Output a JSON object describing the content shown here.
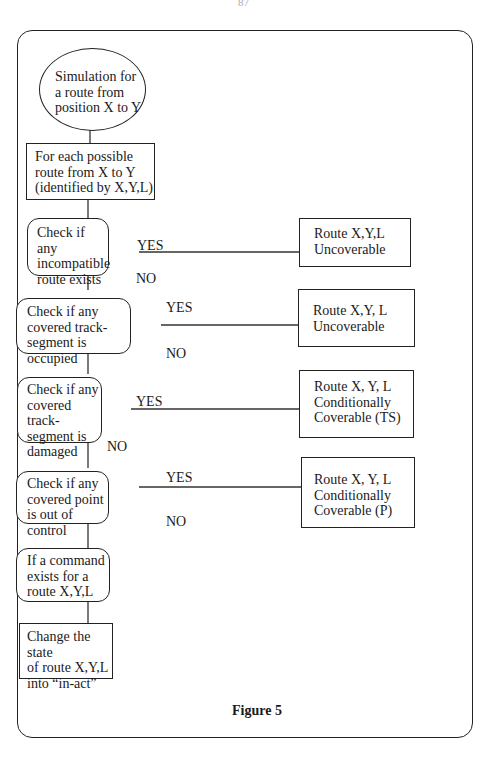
{
  "page_number": "87",
  "figure_caption": "Figure 5",
  "nodes": {
    "start": "Simulation for\na route from\nposition X to Y",
    "foreach": "For each possible\nroute from X to Y\n(identified by X,Y,L)",
    "check1": "Check if any\nincompatible\nroute exists",
    "check2": "Check if any\ncovered track-\nsegment is occupied",
    "check3": "Check if any\ncovered track-\nsegment is\ndamaged",
    "check4": "Check if any\ncovered point\nis out of control",
    "command": "If a command\nexists for a\nroute X,Y,L",
    "change": "Change the state\nof route X,Y,L\ninto “in-act”",
    "result1": "Route X,Y,L\nUncoverable",
    "result2": "Route X,Y, L\nUncoverable",
    "result3": "Route X, Y, L\nConditionally\nCoverable (TS)",
    "result4": "Route X, Y, L\nConditionally\nCoverable (P)"
  },
  "labels": {
    "yes": "YES",
    "no": "NO"
  }
}
